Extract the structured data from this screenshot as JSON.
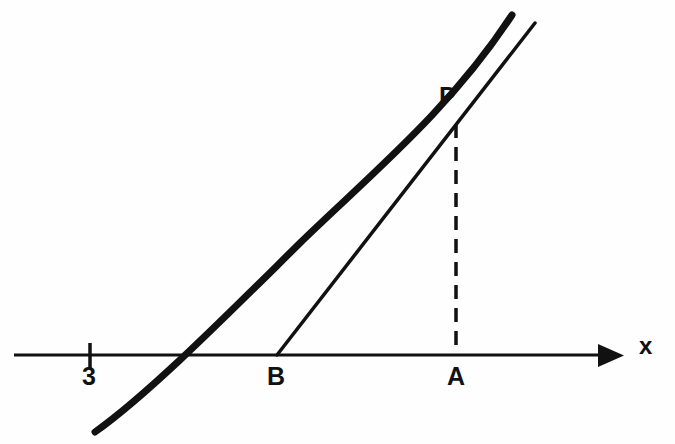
{
  "figure": {
    "background_color": "#fefefe",
    "ink_color": "#111111",
    "width": 675,
    "height": 444
  },
  "axis": {
    "name": "x-axis",
    "label": "x",
    "y_pixel": 355,
    "x_start": 14,
    "x_end": 620,
    "arrow": "right-arrow",
    "stroke_width": 3
  },
  "ticks": [
    {
      "label": "3",
      "x_pixel": 90,
      "top": 343,
      "bottom": 368
    }
  ],
  "points": [
    {
      "name": "P",
      "label": "P",
      "x_pixel": 457,
      "y_pixel": 122,
      "description": "point of tangency on the curve"
    },
    {
      "name": "A",
      "label": "A",
      "x_pixel": 457,
      "y_pixel": 355,
      "description": "foot of the perpendicular from P on the x-axis"
    },
    {
      "name": "B",
      "label": "B",
      "x_pixel": 277,
      "y_pixel": 355,
      "description": "x-intercept of the tangent line"
    }
  ],
  "curve": {
    "name": "curve",
    "stroke_width": 7,
    "path": "M 95 432 C 150 393, 230 312, 300 243 C 370 175, 450 110, 512 15",
    "x_intercept_pixel": 198,
    "description": "increasing concave-up curve crossing the x-axis"
  },
  "tangent": {
    "name": "tangent-line",
    "stroke_width": 3.5,
    "from": [
      277,
      355
    ],
    "to": [
      535,
      23
    ],
    "description": "tangent to the curve at P, meeting the x-axis at B"
  },
  "dashed_segment": {
    "name": "PA-dashed-segment",
    "stroke_width": 3.5,
    "from": [
      456,
      124
    ],
    "to": [
      456,
      355
    ],
    "dash_pattern": "14 9",
    "description": "vertical dashed line from P down to A"
  },
  "labels": {
    "P": "P",
    "A": "A",
    "B": "B",
    "tick_3": "3",
    "axis_x": "x"
  }
}
